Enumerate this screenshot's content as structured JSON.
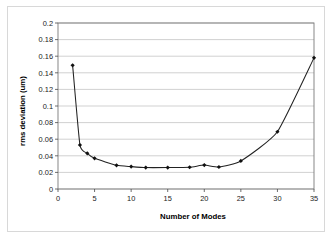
{
  "chart_data": {
    "type": "line",
    "title": "",
    "subtitle": "",
    "xlabel": "Number of Modes",
    "ylabel": "rms deviation (um)",
    "xlim": [
      0,
      35
    ],
    "ylim": [
      0,
      0.2
    ],
    "xticks": [
      0,
      5,
      10,
      15,
      20,
      25,
      30,
      35
    ],
    "xtick_labels": [
      "0",
      "5",
      "10",
      "15",
      "20",
      "25",
      "30",
      "35"
    ],
    "yticks": [
      0,
      0.02,
      0.04,
      0.06,
      0.08,
      0.1,
      0.12,
      0.14,
      0.16,
      0.18,
      0.2
    ],
    "ytick_labels": [
      "0",
      "0.02",
      "0.04",
      "0.06",
      "0.08",
      "0.1",
      "0.12",
      "0.14",
      "0.16",
      "0.18",
      "0.2"
    ],
    "grid": "horizontal",
    "legend": "none",
    "marker": "filled-diamond",
    "line_color": "#222222",
    "marker_color": "#111111",
    "gridline_color": "#bdbdbd",
    "series": [
      {
        "name": "rms deviation",
        "x": [
          2,
          3,
          4,
          5,
          8,
          10,
          12,
          15,
          18,
          20,
          22,
          25,
          30,
          35
        ],
        "y": [
          0.149,
          0.053,
          0.043,
          0.037,
          0.0285,
          0.027,
          0.0258,
          0.0258,
          0.0262,
          0.0288,
          0.0265,
          0.0338,
          0.069,
          0.158
        ]
      }
    ]
  },
  "axis": {
    "x_title": "Number of Modes",
    "y_title": "rms deviation (um)"
  }
}
